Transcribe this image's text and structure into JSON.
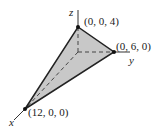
{
  "diagram": {
    "type": "3d-tetrahedron",
    "axes": {
      "x": "x",
      "y": "y",
      "z": "z"
    },
    "vertices": [
      {
        "label": "(0, 0, 4)",
        "coords": [
          0,
          0,
          4
        ]
      },
      {
        "label": "(0, 6, 0)",
        "coords": [
          0,
          6,
          0
        ]
      },
      {
        "label": "(12, 0, 0)",
        "coords": [
          12,
          0,
          0
        ]
      }
    ],
    "colors": {
      "fill": "#c8c8c8",
      "edge": "#222222",
      "axis": "#333333"
    }
  }
}
